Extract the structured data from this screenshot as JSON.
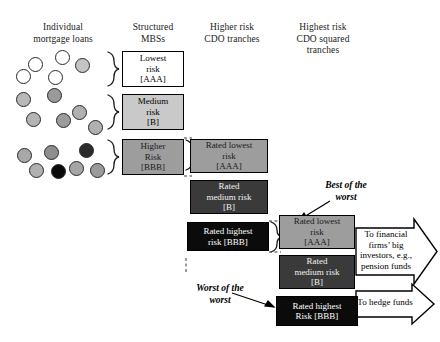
{
  "figure": {
    "background": "#ffffff",
    "columns": [
      {
        "id": "individual-mortgage-loans",
        "line1": "Individual",
        "line2": "mortgage loans",
        "line3": ""
      },
      {
        "id": "structured-mbs",
        "line1": "Structured",
        "line2": "MBSs",
        "line3": ""
      },
      {
        "id": "higher-risk-cdo-tranches",
        "line1": "Higher risk",
        "line2": "CDO tranches",
        "line3": ""
      },
      {
        "id": "highest-risk-cdo-squared",
        "line1": "Highest risk",
        "line2": "CDO squared",
        "line3": "tranches"
      }
    ]
  },
  "loans": {
    "group_aaa": [
      {
        "fill": "#ffffff",
        "x": 28,
        "y": 57,
        "d": 15
      },
      {
        "fill": "#ffffff",
        "x": 55,
        "y": 50,
        "d": 15
      },
      {
        "fill": "#c4c4c4",
        "x": 75,
        "y": 58,
        "d": 15
      },
      {
        "fill": "#ffffff",
        "x": 16,
        "y": 69,
        "d": 15
      },
      {
        "fill": "#ffffff",
        "x": 48,
        "y": 70,
        "d": 15
      }
    ],
    "group_b": [
      {
        "fill": "#b8b8b8",
        "x": 16,
        "y": 92,
        "d": 15
      },
      {
        "fill": "#9a9a9a",
        "x": 47,
        "y": 88,
        "d": 15
      },
      {
        "fill": "#b4b4b4",
        "x": 26,
        "y": 112,
        "d": 15
      },
      {
        "fill": "#9c9c9c",
        "x": 56,
        "y": 113,
        "d": 15
      },
      {
        "fill": "#b0b0b0",
        "x": 72,
        "y": 105,
        "d": 15
      },
      {
        "fill": "#b0b0b0",
        "x": 88,
        "y": 120,
        "d": 15
      }
    ],
    "group_bbb": [
      {
        "fill": "#a8a8a8",
        "x": 17,
        "y": 148,
        "d": 15
      },
      {
        "fill": "#8e8e8e",
        "x": 44,
        "y": 145,
        "d": 15
      },
      {
        "fill": "#2b2b2b",
        "x": 79,
        "y": 143,
        "d": 15
      },
      {
        "fill": "#b0b0b0",
        "x": 29,
        "y": 163,
        "d": 15
      },
      {
        "fill": "#0a0a0a",
        "x": 51,
        "y": 164,
        "d": 15
      },
      {
        "fill": "#a5a5a5",
        "x": 69,
        "y": 161,
        "d": 15
      },
      {
        "fill": "#9a9a9a",
        "x": 90,
        "y": 163,
        "d": 15
      }
    ]
  },
  "mbs_boxes": [
    {
      "id": "mbs-lowest-risk",
      "lines": [
        "Lowest",
        "risk",
        "[AAA]"
      ],
      "style": "bx-white",
      "x": 122,
      "y": 51,
      "w": 62,
      "h": 36
    },
    {
      "id": "mbs-medium-risk",
      "lines": [
        "Medium",
        "risk",
        "[B]"
      ],
      "style": "bx-lgray",
      "x": 122,
      "y": 94,
      "w": 62,
      "h": 36
    },
    {
      "id": "mbs-higher-risk",
      "lines": [
        "Higher",
        "Risk",
        "[BBB]"
      ],
      "style": "bx-mgray",
      "x": 122,
      "y": 139,
      "w": 62,
      "h": 36
    }
  ],
  "cdo_boxes": [
    {
      "id": "cdo-rated-lowest-risk",
      "lines": [
        "Rated lowest",
        "risk",
        "[AAA]"
      ],
      "style": "bx-mgray",
      "x": 190,
      "y": 139,
      "w": 78,
      "h": 34
    },
    {
      "id": "cdo-rated-medium-risk",
      "lines": [
        "Rated",
        "medium risk",
        "[B]"
      ],
      "style": "bx-dark",
      "x": 190,
      "y": 180,
      "w": 78,
      "h": 34
    },
    {
      "id": "cdo-rated-highest-risk",
      "lines": [
        "Rated highest",
        "risk [BBB]"
      ],
      "style": "bx-black",
      "x": 187,
      "y": 222,
      "w": 82,
      "h": 29
    }
  ],
  "cdo_squared_boxes": [
    {
      "id": "cdo2-rated-lowest-risk",
      "lines": [
        "Rated lowest",
        "risk",
        "[AAA]"
      ],
      "style": "bx-mgray",
      "x": 279,
      "y": 215,
      "w": 76,
      "h": 34
    },
    {
      "id": "cdo2-rated-medium-risk",
      "lines": [
        "Rated",
        "medium risk",
        "[B]"
      ],
      "style": "bx-dark",
      "x": 279,
      "y": 255,
      "w": 76,
      "h": 34
    },
    {
      "id": "cdo2-rated-highest-risk",
      "lines": [
        "Rated highest",
        "Risk [BBB]"
      ],
      "style": "bx-black",
      "x": 276,
      "y": 296,
      "w": 82,
      "h": 30
    }
  ],
  "annotations": {
    "best_of_the_worst": {
      "line1": "Best of the",
      "line2": "worst",
      "x": 306,
      "y": 180
    },
    "worst_of_the_worst": {
      "line1": "Worst of the",
      "line2": "worst",
      "x": 182,
      "y": 283
    }
  },
  "outflow_arrows": [
    {
      "id": "arrow-to-financial-firms",
      "lines": [
        "To financial",
        "firms’ big",
        "investors, e.g.,",
        "pension funds"
      ],
      "x": 356,
      "y": 228,
      "w": 78,
      "h": 47
    },
    {
      "id": "arrow-to-hedge-funds",
      "lines": [
        "To hedge funds"
      ],
      "x": 356,
      "y": 291,
      "w": 78,
      "h": 26
    }
  ],
  "icons": {
    "brace": "curly-brace-icon",
    "dashed_link": "dashed-connector-icon",
    "pointer_arrow": "pointer-arrow-icon",
    "block_arrow": "block-arrow-icon"
  }
}
